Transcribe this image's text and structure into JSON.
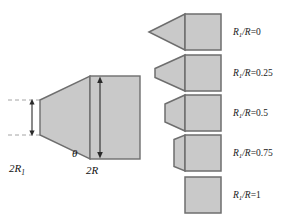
{
  "figure": {
    "type": "engineering-diagram",
    "fill_color": "#c9c9c9",
    "stroke_color": "#6e6e6e",
    "dash_color": "#9a9a9a",
    "text_color": "#1a1a1a",
    "background": "#ffffff"
  },
  "main_diagram": {
    "name": "nose-geometry-definition",
    "labels": {
      "nose_diameter": "2R",
      "nose_diameter_sub": "1",
      "nose_diameter_prefix": "2R",
      "body_diameter": "2R",
      "angle": "θ"
    },
    "geometry": {
      "note": "truncated cone of half-angle theta joined to cylindrical body",
      "small_radius_label": "2R1",
      "large_radius_label": "2R"
    }
  },
  "variants": {
    "name": "nose-shape-family",
    "items": [
      {
        "id": "variant-0",
        "ratio_numerator": "R",
        "ratio_sub": "1",
        "ratio_rest": "/R",
        "equals": "=",
        "value": "0",
        "label": "R1/R=0",
        "nose_type": "sharp-cone",
        "tip_half_height_frac": 0.0,
        "cone_length": 40
      },
      {
        "id": "variant-1",
        "ratio_numerator": "R",
        "ratio_sub": "1",
        "ratio_rest": "/R",
        "equals": "=",
        "value": "0.25",
        "label": "R1/R=0.25",
        "nose_type": "truncated-cone",
        "tip_half_height_frac": 0.25,
        "cone_length": 30
      },
      {
        "id": "variant-2",
        "ratio_numerator": "R",
        "ratio_sub": "1",
        "ratio_rest": "/R",
        "equals": "=",
        "value": "0.5",
        "label": "R1/R=0.5",
        "nose_type": "truncated-cone",
        "tip_half_height_frac": 0.5,
        "cone_length": 20
      },
      {
        "id": "variant-3",
        "ratio_numerator": "R",
        "ratio_sub": "1",
        "ratio_rest": "/R",
        "equals": "=",
        "value": "0.75",
        "label": "R1/R=0.75",
        "nose_type": "truncated-cone",
        "tip_half_height_frac": 0.75,
        "cone_length": 11
      },
      {
        "id": "variant-4",
        "ratio_numerator": "R",
        "ratio_sub": "1",
        "ratio_rest": "/R",
        "equals": "=",
        "value": "1",
        "label": "R1/R=1",
        "nose_type": "flat-blunt",
        "tip_half_height_frac": 1.0,
        "cone_length": 0
      }
    ]
  }
}
